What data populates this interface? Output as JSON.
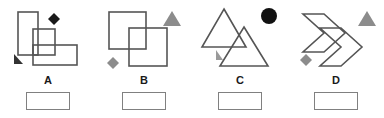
{
  "exercise": {
    "panel_count": 4,
    "stroke_color": "#555555",
    "marker_dark_color": "#1a1a1a",
    "marker_gray_color": "#8c8c8c",
    "answer_box_border_color": "#808080",
    "background_color": "#ffffff"
  },
  "panels": [
    {
      "id": "A",
      "label": "A",
      "shape_kind": "overlapping-rectangles",
      "shape_count": 3,
      "answer_value": "",
      "answer_placeholder": "",
      "markers": [
        {
          "name": "black-diamond-marker",
          "glyph": "diamond",
          "color": "#1a1a1a"
        },
        {
          "name": "dark-triangle-marker",
          "glyph": "triangle",
          "color": "#333333"
        }
      ]
    },
    {
      "id": "B",
      "label": "B",
      "shape_kind": "overlapping-squares",
      "shape_count": 2,
      "answer_value": "",
      "answer_placeholder": "",
      "markers": [
        {
          "name": "gray-triangle-marker",
          "glyph": "triangle",
          "color": "#8c8c8c"
        },
        {
          "name": "gray-diamond-marker",
          "glyph": "diamond",
          "color": "#8c8c8c"
        }
      ]
    },
    {
      "id": "C",
      "label": "C",
      "shape_kind": "overlapping-triangles",
      "shape_count": 2,
      "answer_value": "",
      "answer_placeholder": "",
      "markers": [
        {
          "name": "black-circle-marker",
          "glyph": "circle",
          "color": "#111111"
        },
        {
          "name": "gray-triangle-marker",
          "glyph": "triangle",
          "color": "#9a9a9a"
        }
      ]
    },
    {
      "id": "D",
      "label": "D",
      "shape_kind": "overlapping-chevrons",
      "shape_count": 2,
      "answer_value": "",
      "answer_placeholder": "",
      "markers": [
        {
          "name": "gray-triangle-marker",
          "glyph": "triangle",
          "color": "#8c8c8c"
        },
        {
          "name": "gray-diamond-marker",
          "glyph": "diamond",
          "color": "#8c8c8c"
        }
      ]
    }
  ]
}
